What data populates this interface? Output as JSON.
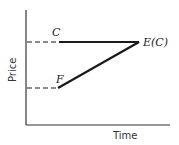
{
  "diagram": {
    "axes": {
      "x_label": "Time",
      "y_label": "Price"
    },
    "levels": [
      {
        "id": "C",
        "label": "C",
        "y_rel": "high"
      },
      {
        "id": "F",
        "label": "F",
        "y_rel": "low"
      }
    ],
    "endpoint_label": "E(C)",
    "colors": {
      "line": "#1a1a1a",
      "axis": "#333333",
      "background": "#ffffff"
    }
  }
}
